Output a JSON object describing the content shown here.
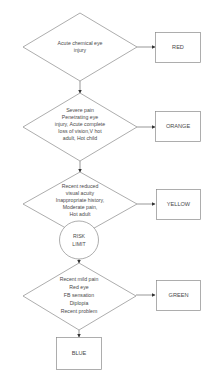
{
  "diagram": {
    "type": "flowchart",
    "decisions": [
      {
        "id": "d1",
        "lines": [
          "Acute chemical eye",
          "injury"
        ]
      },
      {
        "id": "d2",
        "lines": [
          "Severe pain",
          "Penetrating eye",
          "injury, Acute complete",
          "loss of vision,V hot",
          "adult, Hot child"
        ]
      },
      {
        "id": "d3",
        "lines": [
          "Recent reduced",
          "visual acuity",
          "Inappropriate history,",
          "Moderate pain,",
          "Hot adult"
        ]
      },
      {
        "id": "d4",
        "lines": [
          "Recent mild pain",
          "Red eye",
          "FB sensation",
          "Diplopia",
          "Recent problem"
        ]
      }
    ],
    "outcomes": [
      {
        "id": "red",
        "label": "RED"
      },
      {
        "id": "orange",
        "label": "ORANGE"
      },
      {
        "id": "yellow",
        "label": "YELLOW"
      },
      {
        "id": "green",
        "label": "GREEN"
      },
      {
        "id": "blue",
        "label": "BLUE"
      }
    ],
    "connector": {
      "lines": [
        "RISK",
        "LIMIT"
      ]
    },
    "edges": [
      {
        "from": "d1",
        "to": "red"
      },
      {
        "from": "d1",
        "to": "d2"
      },
      {
        "from": "d2",
        "to": "orange"
      },
      {
        "from": "d2",
        "to": "d3"
      },
      {
        "from": "d3",
        "to": "yellow"
      },
      {
        "from": "d3",
        "to": "risk-limit"
      },
      {
        "from": "risk-limit",
        "to": "d4"
      },
      {
        "from": "d4",
        "to": "green"
      },
      {
        "from": "d4",
        "to": "blue"
      }
    ]
  }
}
